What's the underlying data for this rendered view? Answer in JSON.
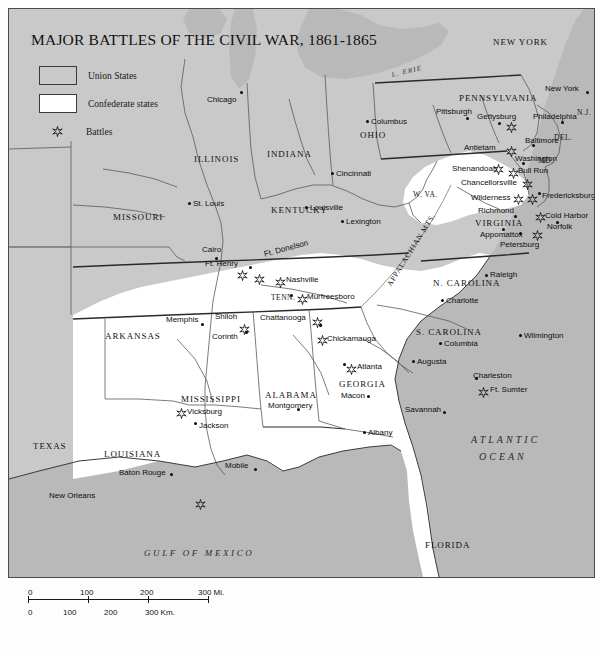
{
  "title": "MAJOR BATTLES OF THE CIVIL WAR, 1861-1865",
  "legend": {
    "union": "Union States",
    "confederate": "Confederate states",
    "battles": "Battles"
  },
  "scale": {
    "miles": [
      "0",
      "100",
      "200",
      "300 Mi."
    ],
    "km": [
      "0",
      "100",
      "200",
      "300 Km."
    ]
  },
  "water": [
    {
      "name": "ATLANTIC OCEAN",
      "line1": "ATLANTIC",
      "line2": "OCEAN"
    },
    {
      "name": "GULF OF MEXICO",
      "line1": "GULF OF MEXICO"
    },
    {
      "name": "L. ERIE",
      "line1": "L. ERIE"
    }
  ],
  "mountains": "APPALACHIAN MTS.",
  "states": [
    {
      "label": "NEW YORK"
    },
    {
      "label": "PENNSYLVANIA"
    },
    {
      "label": "OHIO"
    },
    {
      "label": "INDIANA"
    },
    {
      "label": "ILLINOIS"
    },
    {
      "label": "MISSOURI"
    },
    {
      "label": "KENTUCKY"
    },
    {
      "label": "W. VA."
    },
    {
      "label": "VIRGINIA"
    },
    {
      "label": "TENN."
    },
    {
      "label": "ARKANSAS"
    },
    {
      "label": "N. CAROLINA"
    },
    {
      "label": "S. CAROLINA"
    },
    {
      "label": "GEORGIA"
    },
    {
      "label": "ALABAMA"
    },
    {
      "label": "MISSISSIPPI"
    },
    {
      "label": "LOUISIANA"
    },
    {
      "label": "TEXAS"
    },
    {
      "label": "FLORIDA"
    },
    {
      "label": "N.J."
    },
    {
      "label": "DEL."
    },
    {
      "label": "MD."
    }
  ],
  "cities": [
    {
      "label": "Chicago"
    },
    {
      "label": "Columbus"
    },
    {
      "label": "Cincinnati"
    },
    {
      "label": "St. Louis"
    },
    {
      "label": "Louisville"
    },
    {
      "label": "Lexington"
    },
    {
      "label": "Cairo"
    },
    {
      "label": "Memphis"
    },
    {
      "label": "Pittsburgh"
    },
    {
      "label": "New York"
    },
    {
      "label": "Philadelphia"
    },
    {
      "label": "Baltimore"
    },
    {
      "label": "Washington"
    },
    {
      "label": "Richmond"
    },
    {
      "label": "Norfolk"
    },
    {
      "label": "Petersburg"
    },
    {
      "label": "Raleigh"
    },
    {
      "label": "Charlotte"
    },
    {
      "label": "Wilmington"
    },
    {
      "label": "Columbia"
    },
    {
      "label": "Augusta"
    },
    {
      "label": "Charleston"
    },
    {
      "label": "Savannah"
    },
    {
      "label": "Albany"
    },
    {
      "label": "Macon"
    },
    {
      "label": "Montgomery"
    },
    {
      "label": "Mobile"
    },
    {
      "label": "Jackson"
    },
    {
      "label": "Baton Rouge"
    },
    {
      "label": "New Orleans"
    },
    {
      "label": "Nashville"
    },
    {
      "label": "Chattanooga"
    },
    {
      "label": "Corinth"
    },
    {
      "label": "Appomattox"
    },
    {
      "label": "Fredericksburg"
    },
    {
      "label": "Shenandoah"
    }
  ],
  "battles": [
    {
      "label": "Gettysburg"
    },
    {
      "label": "Antietam"
    },
    {
      "label": "Bull Run"
    },
    {
      "label": "Chancellorsville"
    },
    {
      "label": "Wilderness"
    },
    {
      "label": "Cold Harbor"
    },
    {
      "label": "Ft. Henry"
    },
    {
      "label": "Ft. Donelson"
    },
    {
      "label": "Shiloh"
    },
    {
      "label": "Murfreesboro"
    },
    {
      "label": "Chickamauga"
    },
    {
      "label": "Atlanta"
    },
    {
      "label": "Vicksburg"
    },
    {
      "label": "Ft. Sumter"
    }
  ],
  "map_labels": {
    "chicago": "Chicago",
    "columbus": "Columbus",
    "cincinnati": "Cincinnati",
    "st_louis": "St. Louis",
    "louisville": "Louisville",
    "lexington": "Lexington",
    "cairo": "Cairo",
    "memphis": "Memphis",
    "pittsburgh": "Pittsburgh",
    "new_york": "New York",
    "philadelphia": "Philadelphia",
    "baltimore": "Baltimore",
    "washington": "Washington",
    "richmond": "Richmond",
    "norfolk": "Norfolk",
    "petersburg": "Petersburg",
    "raleigh": "Raleigh",
    "charlotte": "Charlotte",
    "wilmington": "Wilmington",
    "columbia": "Columbia",
    "augusta": "Augusta",
    "charleston": "Charleston",
    "savannah": "Savannah",
    "albany": "Albany",
    "macon": "Macon",
    "montgomery": "Montgomery",
    "mobile": "Mobile",
    "jackson": "Jackson",
    "baton_rouge": "Baton Rouge",
    "new_orleans": "New Orleans",
    "nashville": "Nashville",
    "chattanooga": "Chattanooga",
    "corinth": "Corinth",
    "appomattox": "Appomattox",
    "fredericksburg": "Fredericksburg",
    "shenandoah": "Shenandoah",
    "gettysburg": "Gettysburg",
    "antietam": "Antietam",
    "bull_run": "Bull Run",
    "chancellorsville": "Chancellorsville",
    "wilderness": "Wilderness",
    "cold_harbor": "Cold Harbor",
    "ft_henry": "Ft. Henry",
    "ft_donelson": "Ft. Donelson",
    "shiloh": "Shiloh",
    "murfreesboro": "Murfreesboro",
    "chickamauga": "Chickamauga",
    "atlanta": "Atlanta",
    "vicksburg": "Vicksburg",
    "ft_sumter": "Ft. Sumter",
    "new_york_state": "NEW YORK",
    "pennsylvania": "PENNSYLVANIA",
    "ohio": "OHIO",
    "indiana": "INDIANA",
    "illinois": "ILLINOIS",
    "missouri": "MISSOURI",
    "kentucky": "KENTUCKY",
    "w_va": "W. VA.",
    "virginia": "VIRGINIA",
    "tenn": "TENN.",
    "arkansas": "ARKANSAS",
    "n_carolina": "N. CAROLINA",
    "s_carolina": "S. CAROLINA",
    "georgia": "GEORGIA",
    "alabama": "ALABAMA",
    "mississippi": "MISSISSIPPI",
    "louisiana": "LOUISIANA",
    "texas": "TEXAS",
    "florida": "FLORIDA",
    "nj": "N.J.",
    "del": "DEL.",
    "md": "MD.",
    "lake_erie": "L. ERIE",
    "atlantic_1": "ATLANTIC",
    "atlantic_2": "OCEAN",
    "gulf": "GULF OF MEXICO",
    "appalachian": "APPALACHIAN MTS."
  },
  "colors": {
    "union_fill": "#c9c9c9",
    "confederate_fill": "#ffffff",
    "water_fill": "#b9b9b9",
    "border": "#4a4a4a",
    "text": "#0d0d0d"
  }
}
